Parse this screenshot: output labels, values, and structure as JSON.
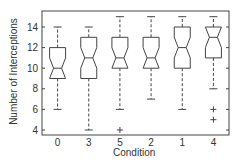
{
  "chart_data": {
    "type": "boxplot",
    "title": "",
    "xlabel": "Condition",
    "ylabel": "Number of Interceptions",
    "ylim": [
      3.5,
      15.5
    ],
    "yticks": [
      4,
      6,
      8,
      10,
      12,
      14
    ],
    "categories": [
      "0",
      "3",
      "5",
      "2",
      "1",
      "4"
    ],
    "notched": true,
    "grid": false,
    "boxes": [
      {
        "label": "0",
        "whisker_low": 6,
        "q1": 9,
        "median": 10,
        "q3": 12,
        "whisker_high": 14,
        "outliers": []
      },
      {
        "label": "3",
        "whisker_low": 4,
        "q1": 9,
        "median": 11,
        "q3": 13,
        "whisker_high": 14,
        "outliers": []
      },
      {
        "label": "5",
        "whisker_low": 6,
        "q1": 10,
        "median": 11,
        "q3": 13,
        "whisker_high": 15,
        "outliers": [
          4
        ]
      },
      {
        "label": "2",
        "whisker_low": 7,
        "q1": 10,
        "median": 11,
        "q3": 13,
        "whisker_high": 15,
        "outliers": []
      },
      {
        "label": "1",
        "whisker_low": 6,
        "q1": 10,
        "median": 12,
        "q3": 14,
        "whisker_high": 15,
        "outliers": []
      },
      {
        "label": "4",
        "whisker_low": 8,
        "q1": 11,
        "median": 13,
        "q3": 14,
        "whisker_high": 15,
        "outliers": [
          6,
          5
        ]
      }
    ]
  }
}
